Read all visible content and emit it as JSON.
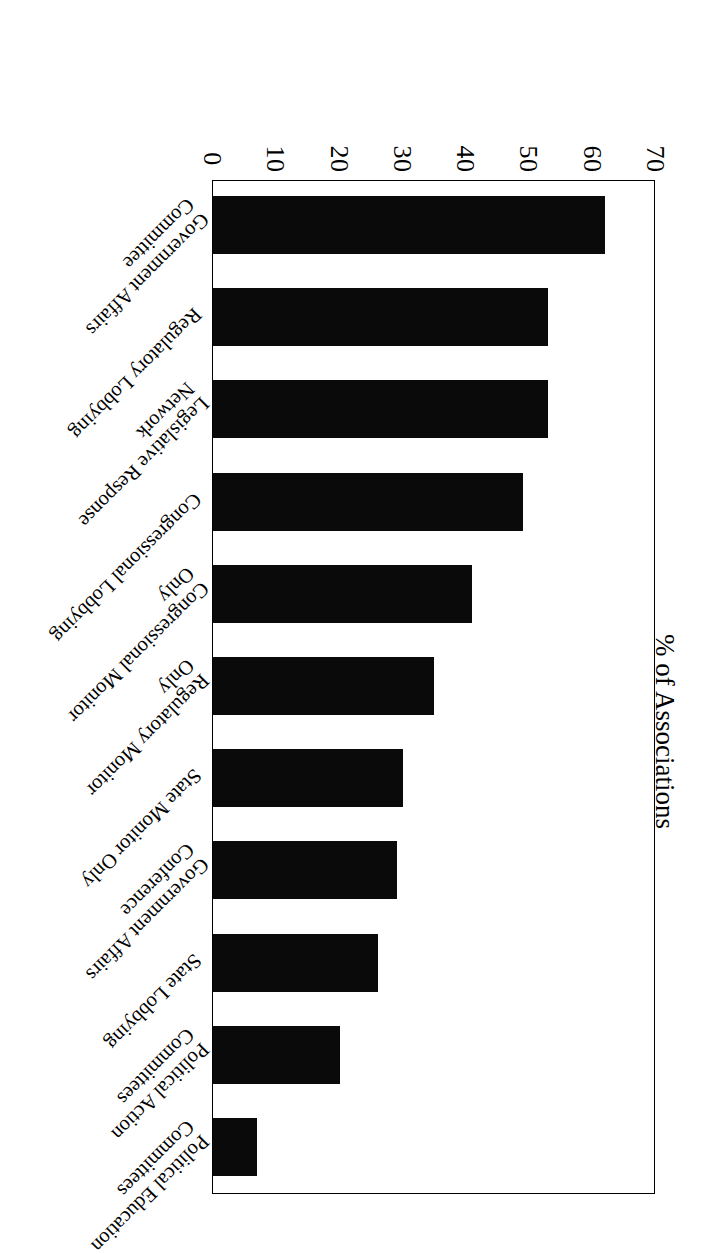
{
  "chart_data": {
    "type": "bar",
    "orientation": "horizontal",
    "title": "",
    "xlabel": "",
    "ylabel": "% of Associations",
    "ylim": [
      0,
      70
    ],
    "tick_labels": [
      "0",
      "10",
      "20",
      "30",
      "40",
      "50",
      "60",
      "70"
    ],
    "tick_values": [
      0,
      10,
      20,
      30,
      40,
      50,
      60,
      70
    ],
    "grid": false,
    "legend": false,
    "bar_color": "#0a0a0a",
    "categories": [
      "Government Affairs Committee",
      "Regulatory Lobbying",
      "Legislative Response Network",
      "Congressional Lobbying",
      "Congressional Monitor Only",
      "Regulatory Monitor Only",
      "State Monitor Only",
      "Government Affairs Conference",
      "State Lobbying",
      "Political Action Committees",
      "Political Education Committees"
    ],
    "categories_wrapped": [
      [
        "Government Affairs",
        "Committee"
      ],
      [
        "Regulatory Lobbying",
        ""
      ],
      [
        "Legislative Response",
        "Network"
      ],
      [
        "Congressional Lobbying",
        ""
      ],
      [
        "Congressional Monitor",
        "Only"
      ],
      [
        "Regulatory Monitor",
        "Only"
      ],
      [
        "State Monitor Only",
        ""
      ],
      [
        "Government Affairs",
        "Conference"
      ],
      [
        "State Lobbying",
        ""
      ],
      [
        "Political Action",
        "Committees"
      ],
      [
        "Political Education",
        "Committees"
      ]
    ],
    "values": [
      62,
      53,
      53,
      49,
      41,
      35,
      30,
      29,
      26,
      20,
      7
    ]
  },
  "axis": {
    "value_axis_title": "% of Associations"
  },
  "page": {
    "rotation_degrees": 180,
    "background": "#ffffff"
  }
}
